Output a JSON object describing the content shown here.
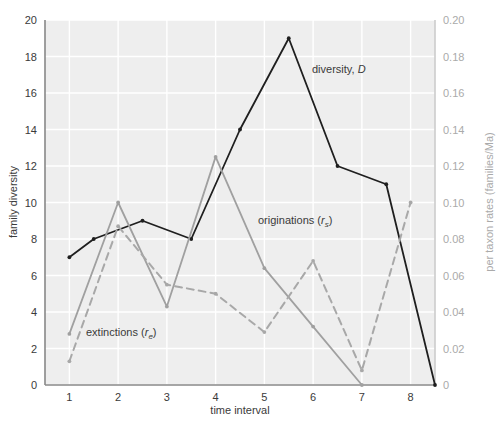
{
  "figure": {
    "background": "#ffffff",
    "plot_background": "#eeeeee",
    "gridline_color": "#ffffff"
  },
  "chart_data": {
    "type": "line",
    "title": "",
    "xlabel": "time interval",
    "ylabel": "family diversity",
    "y2label": "per taxon rates (families/Ma)",
    "xlim": [
      0.5,
      8.5
    ],
    "ylim": [
      0,
      20
    ],
    "y2lim": [
      0,
      0.2
    ],
    "grid": true,
    "legend_position": "inline-annotations",
    "xticks": [
      1,
      2,
      3,
      4,
      5,
      6,
      7,
      8
    ],
    "xtick_labels": [
      "1",
      "2",
      "3",
      "4",
      "5",
      "6",
      "7",
      "8"
    ],
    "yticks": [
      0,
      2,
      4,
      6,
      8,
      10,
      12,
      14,
      16,
      18,
      20
    ],
    "ytick_labels": [
      "0",
      "2",
      "4",
      "6",
      "8",
      "10",
      "12",
      "14",
      "16",
      "18",
      "20"
    ],
    "y2ticks": [
      0,
      0.02,
      0.04,
      0.06,
      0.08,
      0.1,
      0.12,
      0.14,
      0.16,
      0.18,
      0.2
    ],
    "y2tick_labels": [
      "0",
      "0.02",
      "0.04",
      "0.06",
      "0.08",
      "0.10",
      "0.12",
      "0.14",
      "0.16",
      "0.18",
      "0.20"
    ],
    "series": [
      {
        "name": "diversity, D",
        "axis": "left",
        "color": "#1f1f1f",
        "linestyle": "solid",
        "markers": true,
        "x": [
          1,
          1.5,
          2.5,
          3.5,
          4.5,
          5.5,
          6.5,
          7.5,
          8.5
        ],
        "values": [
          7,
          8,
          9,
          8,
          14,
          19,
          12,
          11,
          0
        ]
      },
      {
        "name": "originations (rs)",
        "axis": "right",
        "color": "#a0a0a0",
        "linestyle": "solid",
        "markers": true,
        "x": [
          1,
          2,
          3,
          4,
          5,
          6,
          7
        ],
        "values": [
          0.028,
          0.1,
          0.043,
          0.125,
          0.064,
          0.032,
          0.0
        ]
      },
      {
        "name": "extinctions (re)",
        "axis": "right",
        "color": "#a8a8a8",
        "linestyle": "dashed",
        "markers": true,
        "x": [
          1,
          2,
          3,
          4,
          5,
          6,
          7,
          8
        ],
        "values": [
          0.013,
          0.087,
          0.055,
          0.05,
          0.029,
          0.068,
          0.008,
          0.1
        ]
      }
    ],
    "annotations": [
      {
        "name": "diversity-label",
        "text_plain": "diversity, D",
        "text_main": "diversity, ",
        "text_italic": "D",
        "x_px": 312,
        "y_px": 73
      },
      {
        "name": "originations-label",
        "text_plain": "originations (rs)",
        "text_main": "originations (",
        "text_italic": "r",
        "text_sub": "s",
        "text_tail": ")",
        "x_px": 258,
        "y_px": 224
      },
      {
        "name": "extinctions-label",
        "text_plain": "extinctions (re)",
        "text_main": "extinctions (",
        "text_italic": "r",
        "text_sub": "e",
        "text_tail": ")",
        "x_px": 86,
        "y_px": 336
      }
    ]
  }
}
